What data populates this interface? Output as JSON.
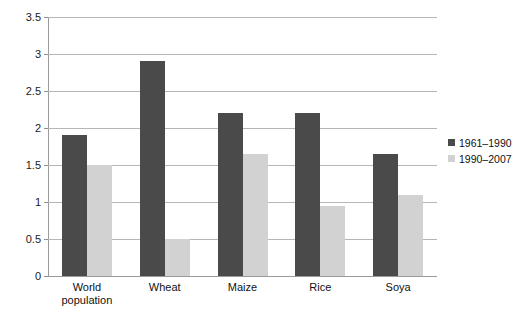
{
  "chart_data": {
    "type": "bar",
    "title": "",
    "subtitle": "",
    "xlabel": "",
    "ylabel": "",
    "categories": [
      "World\npopulation",
      "Wheat",
      "Maize",
      "Rice",
      "Soya"
    ],
    "series": [
      {
        "name": "1961–1990",
        "color": "#4a4a4a",
        "values": [
          1.9,
          2.9,
          2.2,
          2.2,
          1.65
        ]
      },
      {
        "name": "1990–2007",
        "color": "#d2d2d2",
        "values": [
          1.5,
          0.5,
          1.65,
          0.95,
          1.1
        ]
      }
    ],
    "ylim": [
      0,
      3.5
    ],
    "ytick_step": 0.5,
    "yticks": [
      "0",
      "0.5",
      "1",
      "1.5",
      "2",
      "2.5",
      "3",
      "3.5"
    ],
    "ytick_values": [
      0,
      0.5,
      1,
      1.5,
      2,
      2.5,
      3,
      3.5
    ],
    "grid": true,
    "grid_axis": "y",
    "legend_position": "right",
    "axis_color": "#9a9a9a",
    "grid_color": "#b6b6b6",
    "background": "#ffffff"
  }
}
